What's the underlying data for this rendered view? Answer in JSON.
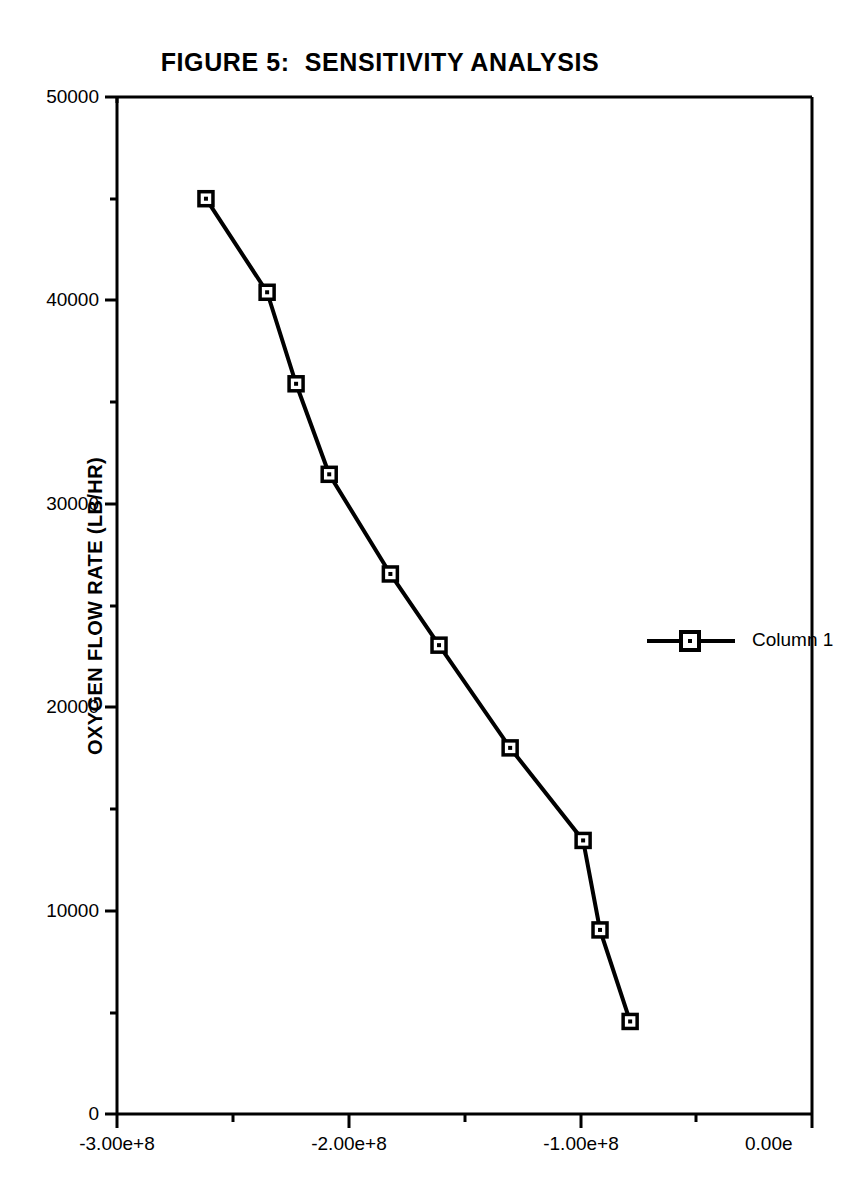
{
  "figure": {
    "title": "FIGURE 5:  SENSITIVITY ANALYSIS",
    "background_color": "#ffffff",
    "ink_color": "#000000"
  },
  "axes": {
    "y_axis_title": "OXYGEN FLOW RATE (LB/HR)",
    "x_axis_title": "",
    "y_tick_labels": [
      "50000",
      "40000",
      "30000",
      "20000",
      "10000",
      "0"
    ],
    "x_tick_labels": [
      "-3.00e+8",
      "-2.00e+8",
      "-1.00e+8",
      "0.00e"
    ]
  },
  "legend": {
    "entries": [
      {
        "label": "Column 1",
        "marker": "square",
        "color": "#000000"
      }
    ]
  },
  "chart_data": {
    "type": "line",
    "title": "FIGURE 5:  SENSITIVITY ANALYSIS",
    "xlabel": "",
    "ylabel": "OXYGEN FLOW RATE (LB/HR)",
    "xlim": [
      -300000000,
      0
    ],
    "ylim": [
      0,
      50000
    ],
    "xticks": [
      -300000000,
      -200000000,
      -100000000,
      0
    ],
    "xtick_labels": [
      "-3.00e+8",
      "-2.00e+8",
      "-1.00e+8",
      "0.00e"
    ],
    "x_minor_ticks": [
      -250000000,
      -150000000,
      -50000000
    ],
    "yticks": [
      0,
      10000,
      20000,
      30000,
      40000,
      50000
    ],
    "ytick_labels": [
      "0",
      "10000",
      "20000",
      "30000",
      "40000",
      "50000"
    ],
    "y_minor_ticks": [
      5000,
      15000,
      25000,
      35000,
      45000
    ],
    "grid": false,
    "legend_position": "right",
    "series": [
      {
        "name": "Column 1",
        "marker": "square",
        "color": "#000000",
        "x": [
          -261600000,
          -235200000,
          -222700000,
          -208400000,
          -182000000,
          -161000000,
          -130300000,
          -98800000,
          -91500000,
          -78500000
        ],
        "y": [
          45000,
          40400,
          35900,
          31450,
          26550,
          23050,
          18000,
          13450,
          9050,
          4550
        ]
      }
    ]
  }
}
